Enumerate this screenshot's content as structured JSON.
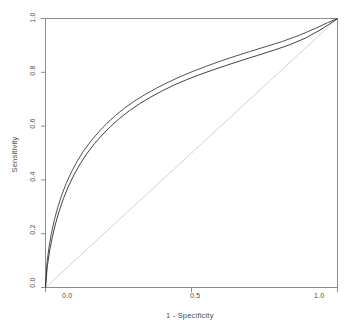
{
  "chart_data": {
    "type": "line",
    "title": "",
    "xlabel": "1 - Specificity",
    "ylabel": "Sensitivity",
    "xlim": [
      0,
      1
    ],
    "ylim": [
      0,
      1
    ],
    "grid": false,
    "legend": "none",
    "xticks": [
      "0.0",
      "0.5",
      "1.0"
    ],
    "xtick_values": [
      0.0,
      0.5,
      1.0
    ],
    "yticks": [
      "0.0",
      "0.2",
      "0.4",
      "0.6",
      "0.8",
      "1.0"
    ],
    "ytick_values": [
      0.0,
      0.2,
      0.4,
      0.6,
      0.8,
      1.0
    ],
    "series": [
      {
        "name": "roc-curve-1",
        "color": "#3c3c3c",
        "x": [
          0.0,
          0.005,
          0.012,
          0.02,
          0.03,
          0.042,
          0.056,
          0.072,
          0.09,
          0.11,
          0.132,
          0.156,
          0.182,
          0.21,
          0.24,
          0.272,
          0.306,
          0.342,
          0.38,
          0.42,
          0.462,
          0.506,
          0.552,
          0.6,
          0.65,
          0.702,
          0.756,
          0.812,
          0.87,
          0.93,
          0.965,
          1.0
        ],
        "y": [
          0.0,
          0.09,
          0.15,
          0.2,
          0.25,
          0.298,
          0.345,
          0.39,
          0.432,
          0.472,
          0.51,
          0.545,
          0.578,
          0.61,
          0.64,
          0.668,
          0.694,
          0.718,
          0.741,
          0.763,
          0.784,
          0.804,
          0.823,
          0.842,
          0.86,
          0.878,
          0.896,
          0.915,
          0.938,
          0.966,
          0.984,
          1.0
        ]
      },
      {
        "name": "roc-curve-2",
        "color": "#2b2b2b",
        "x": [
          0.0,
          0.006,
          0.014,
          0.023,
          0.034,
          0.047,
          0.062,
          0.079,
          0.098,
          0.119,
          0.142,
          0.167,
          0.194,
          0.223,
          0.254,
          0.287,
          0.322,
          0.359,
          0.398,
          0.439,
          0.482,
          0.527,
          0.574,
          0.623,
          0.674,
          0.727,
          0.782,
          0.838,
          0.89,
          0.94,
          0.972,
          1.0
        ],
        "y": [
          0.0,
          0.078,
          0.136,
          0.186,
          0.236,
          0.285,
          0.332,
          0.377,
          0.42,
          0.46,
          0.498,
          0.534,
          0.567,
          0.599,
          0.629,
          0.657,
          0.683,
          0.707,
          0.73,
          0.752,
          0.772,
          0.791,
          0.809,
          0.827,
          0.845,
          0.863,
          0.882,
          0.903,
          0.927,
          0.957,
          0.979,
          1.0
        ]
      },
      {
        "name": "chance-diagonal",
        "color": "#d2d2d2",
        "x": [
          0.0,
          1.0
        ],
        "y": [
          0.0,
          1.0
        ]
      }
    ]
  },
  "axes": {
    "box_color": "#8c8c8c",
    "tick_color": "#8c8c8c"
  }
}
